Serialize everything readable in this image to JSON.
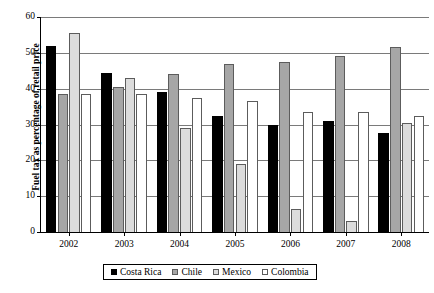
{
  "chart_data": {
    "type": "bar",
    "title": "",
    "subtitle": "",
    "xlabel": "",
    "ylabel": "Fuel tax as percentage of retail price",
    "categories": [
      "2002",
      "2003",
      "2004",
      "2005",
      "2006",
      "2007",
      "2008"
    ],
    "series": [
      {
        "name": "Costa Rica",
        "color": "#000000",
        "values": [
          52,
          44.5,
          39,
          32.5,
          30,
          31,
          27.5
        ]
      },
      {
        "name": "Chile",
        "color": "#a6a6a6",
        "values": [
          38.5,
          40.5,
          44,
          47,
          47.5,
          49,
          51.5
        ]
      },
      {
        "name": "Mexico",
        "color": "#dcdcdc",
        "values": [
          55.5,
          43,
          29,
          19,
          6.5,
          3,
          30.5
        ]
      },
      {
        "name": "Colombia",
        "color": "#ffffff",
        "values": [
          38.5,
          38.5,
          37.5,
          36.5,
          33.5,
          33.5,
          32.5
        ]
      }
    ],
    "ylim": [
      0,
      60
    ],
    "yticks": [
      0,
      10,
      20,
      30,
      40,
      50,
      60
    ],
    "ytick_labels": [
      "0",
      "10",
      "20",
      "30",
      "40",
      "50",
      "60"
    ],
    "grid": true,
    "grid_axis": "y",
    "legend_position": "bottom",
    "legend_entries": [
      "Costa Rica",
      "Chile",
      "Mexico",
      "Colombia"
    ]
  }
}
